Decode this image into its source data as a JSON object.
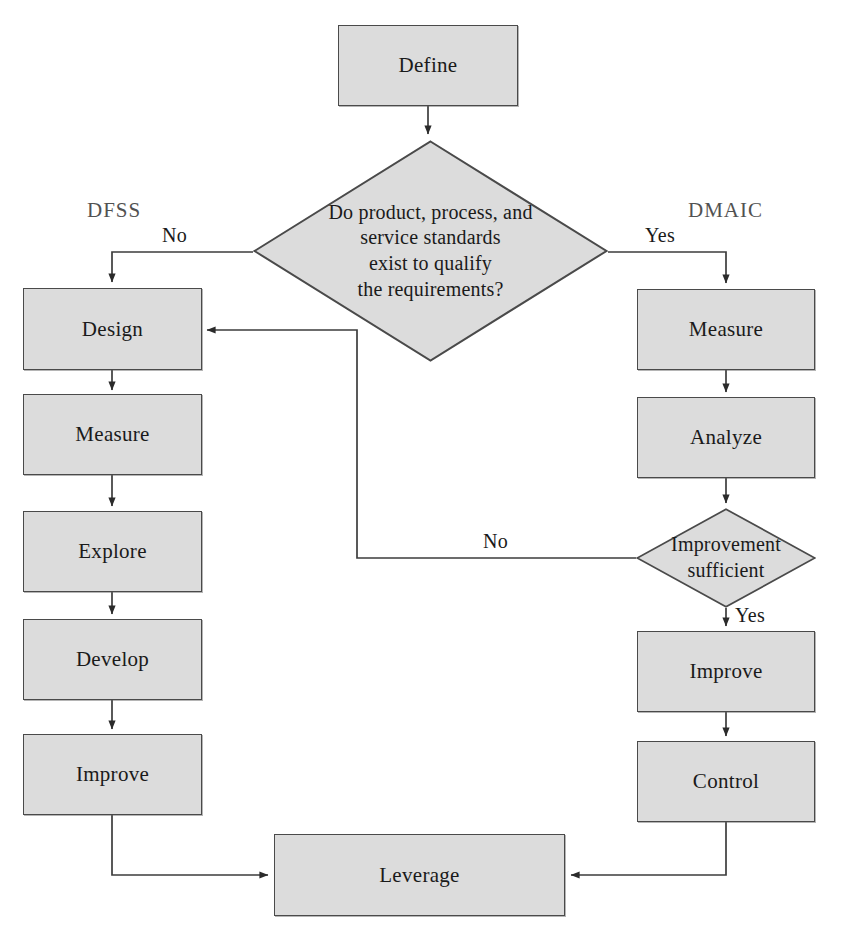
{
  "diagram": {
    "type": "flowchart",
    "colors": {
      "node_fill": "#dcdcdc",
      "node_border": "#4a4a4a",
      "edge": "#3d3d3d",
      "text": "#1a1a1a",
      "background": "#ffffff"
    },
    "branch_titles": {
      "left": "DFSS",
      "right": "DMAIC"
    },
    "nodes": {
      "define": "Define",
      "decision_standards": "Do product, process, and service standards exist to qualify the requirements?",
      "decision_standards_lines": [
        "Do product, process, and",
        "service standards",
        "exist to qualify",
        "the requirements?"
      ],
      "left_design": "Design",
      "left_measure": "Measure",
      "left_explore": "Explore",
      "left_develop": "Develop",
      "left_improve": "Improve",
      "right_measure": "Measure",
      "right_analyze": "Analyze",
      "decision_improvement": "Improvement sufficient",
      "decision_improvement_lines": [
        "Improvement",
        "sufficient"
      ],
      "right_improve": "Improve",
      "right_control": "Control",
      "leverage": "Leverage"
    },
    "edge_labels": {
      "no_left": "No",
      "yes_right": "Yes",
      "no_feedback": "No",
      "yes_down": "Yes"
    }
  }
}
